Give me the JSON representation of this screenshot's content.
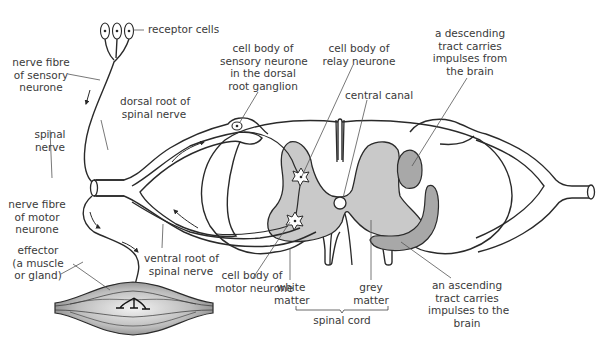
{
  "diagram": {
    "colors": {
      "outline": "#2a2a2a",
      "grey_matter": "#c9c9c9",
      "tract": "#a8a8a8",
      "label_text": "#3a3a3a",
      "leader_line": "#555555",
      "muscle_light": "#e6e6e6",
      "muscle_dark": "#8a8a8a"
    },
    "labels": {
      "receptor_cells": [
        "receptor cells"
      ],
      "nerve_fibre_sensory": [
        "nerve fibre",
        "of sensory",
        "neurone"
      ],
      "dorsal_root": [
        "dorsal root of",
        "spinal nerve"
      ],
      "spinal_nerve": [
        "spinal",
        "nerve"
      ],
      "nerve_fibre_motor": [
        "nerve fibre",
        "of motor",
        "neurone"
      ],
      "effector": [
        "effector",
        "(a muscle",
        "or gland)"
      ],
      "ventral_root": [
        "ventral root of",
        "spinal nerve"
      ],
      "cell_body_sensory": [
        "cell body of",
        "sensory neurone",
        "in the dorsal",
        "root ganglion"
      ],
      "cell_body_relay": [
        "cell body of",
        "relay neurone"
      ],
      "central_canal": [
        "central canal"
      ],
      "descending_tract": [
        "a descending",
        "tract carries",
        "impulses from",
        "the brain"
      ],
      "cell_body_motor": [
        "cell body of",
        "motor neurone"
      ],
      "white_matter": [
        "white",
        "matter"
      ],
      "grey_matter": [
        "grey",
        "matter"
      ],
      "spinal_cord": [
        "spinal cord"
      ],
      "ascending_tract": [
        "an ascending",
        "tract carries",
        "impulses to the",
        "brain"
      ]
    },
    "icons": {
      "receptor_cell": "oval-with-nucleus",
      "neurone_cell_body": "star-with-nucleus",
      "direction_arrow": "curved-arrow",
      "motor_end_plate": "t-bar"
    }
  }
}
